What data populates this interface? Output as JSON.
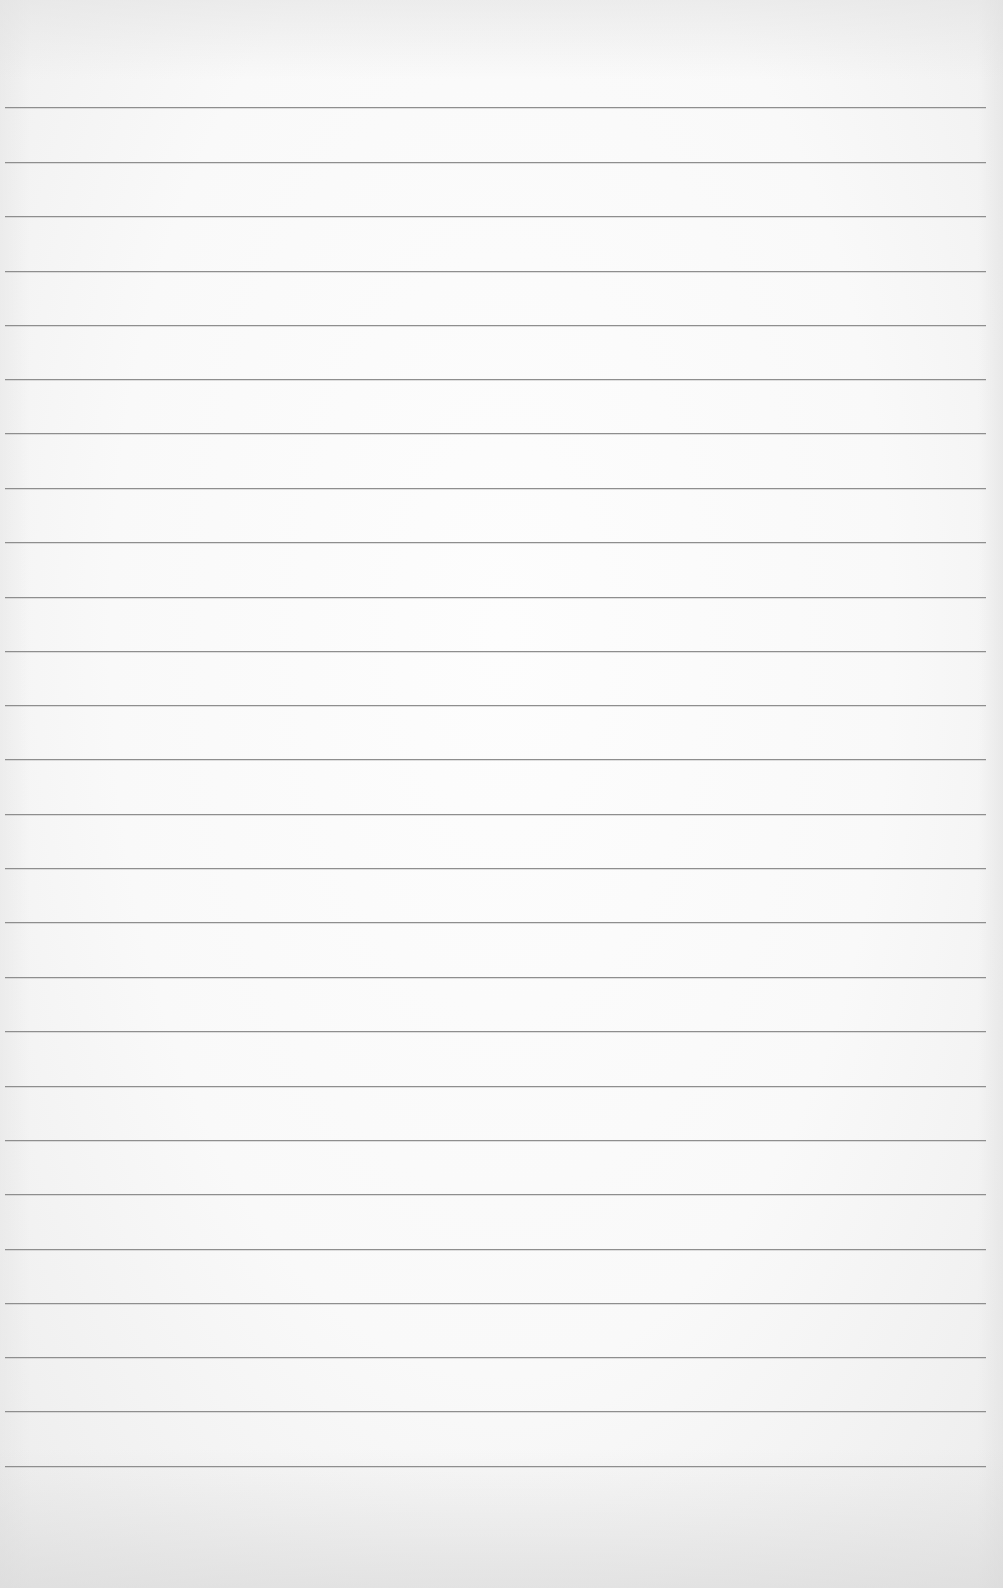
{
  "paper": {
    "type": "lined-paper",
    "background_color": "#fafafa",
    "rule_color": "#8e8e8e",
    "rule_count": 26,
    "rule_positions_y": [
      107,
      162,
      216,
      271,
      325,
      379,
      433,
      488,
      542,
      597,
      651,
      705,
      759,
      814,
      868,
      922,
      977,
      1031,
      1086,
      1140,
      1194,
      1249,
      1303,
      1357,
      1411,
      1466
    ]
  }
}
